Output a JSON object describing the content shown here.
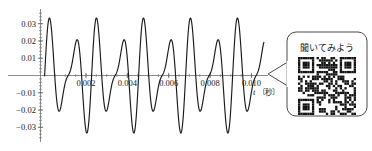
{
  "figure": {
    "background_color": "#ffffff",
    "curve_color": "#1a1a1a",
    "axis_color": "#6e6e6e",
    "text_color": "#1a1a1a"
  },
  "chart_data": {
    "type": "line",
    "title": "",
    "subtitle": "",
    "xlabel": "t",
    "xunit": "〔秒〕",
    "ylabel": "",
    "xlim": [
      -0.0002,
      0.0108
    ],
    "ylim": [
      -0.0385,
      0.0385
    ],
    "grid": false,
    "legend": null,
    "x_tick_labels": [
      "0.002",
      "0.004",
      "0.006",
      "0.008",
      "0.010"
    ],
    "x_ticks": [
      0.002,
      0.004,
      0.006,
      0.008,
      0.01
    ],
    "y_tick_labels": [
      "0.03",
      "0.02",
      "0.01",
      "-0.01",
      "-0.02",
      "-0.03"
    ],
    "y_ticks": [
      0.03,
      0.02,
      0.01,
      -0.01,
      -0.02,
      -0.03
    ],
    "series": [
      {
        "name": "beat-waveform",
        "model": "sum_of_two_sines",
        "components": [
          {
            "amplitude": 0.0225,
            "frequency_hz": 880
          },
          {
            "amplitude": 0.0125,
            "frequency_hz": 1320
          }
        ],
        "peak_amplitude_major": 0.035,
        "peak_amplitude_minor": 0.01,
        "trough_amplitude_major": -0.033,
        "trough_amplitude_minor": -0.009,
        "envelope_period_s": 0.00227,
        "sample_count": 900
      }
    ]
  },
  "callout": {
    "label": "聞いてみよう",
    "qr_alt": "qr-code",
    "border_color": "#4a4a4a",
    "fill_color": "#ffffff"
  }
}
